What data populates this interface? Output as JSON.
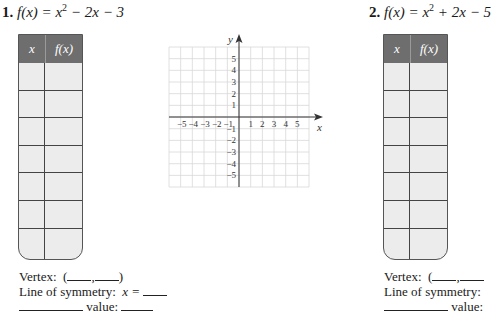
{
  "problems": [
    {
      "number": "1.",
      "equation_lhs": "f(x) = x",
      "equation_exp": "2",
      "equation_rhs": " − 2x − 3",
      "table": {
        "headers": [
          "x",
          "f(x)"
        ],
        "rows": [
          [
            "",
            ""
          ],
          [
            "",
            ""
          ],
          [
            "",
            ""
          ],
          [
            "",
            ""
          ],
          [
            "",
            ""
          ],
          [
            "",
            ""
          ],
          [
            "",
            ""
          ]
        ]
      },
      "vertex_label": "Vertex:",
      "vertex_open": "(",
      "vertex_comma": ",",
      "vertex_close": ")",
      "symmetry_label": "Line of symmetry:",
      "symmetry_var": "x =",
      "value_label": "value:"
    },
    {
      "number": "2.",
      "equation_lhs": "f(x) = x",
      "equation_exp": "2",
      "equation_rhs": " + 2x − 5",
      "table": {
        "headers": [
          "x",
          "f(x)"
        ],
        "rows": [
          [
            "",
            ""
          ],
          [
            "",
            ""
          ],
          [
            "",
            ""
          ],
          [
            "",
            ""
          ],
          [
            "",
            ""
          ],
          [
            "",
            ""
          ],
          [
            "",
            ""
          ]
        ]
      },
      "vertex_label": "Vertex:",
      "vertex_open": "(",
      "vertex_comma": ",",
      "symmetry_label": "Line of symmetry:",
      "value_label": "value:"
    }
  ],
  "graph": {
    "x_axis_label": "x",
    "y_axis_label": "y",
    "x_ticks_negative": [
      "−5",
      "−4",
      "−3",
      "−2",
      "−1"
    ],
    "x_ticks_positive": [
      "1",
      "2",
      "3",
      "4",
      "5"
    ],
    "y_ticks_positive": [
      "5",
      "4",
      "3",
      "2",
      "1"
    ],
    "y_ticks_negative": [
      "−1",
      "−2",
      "−3",
      "−4",
      "−5"
    ],
    "grid_range": [
      -6,
      6
    ],
    "grid_color": "#d8d8d8",
    "axis_color": "#333333"
  },
  "colors": {
    "table_header": "#6e6e6e",
    "table_cell": "#ececec",
    "table_line": "#444444"
  }
}
